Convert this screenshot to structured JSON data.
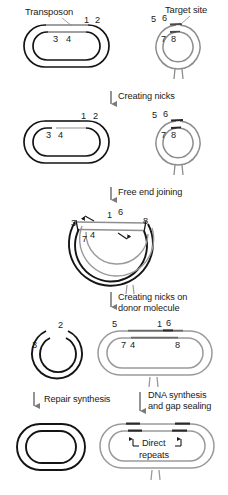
{
  "figure": {
    "width": 228,
    "height": 495,
    "background": "#ffffff",
    "colors": {
      "donor_dna": "#141414",
      "target_dna": "#8c8c8c",
      "text": "#1a1a1a",
      "arrow": "#6e6e6e"
    }
  },
  "headers": {
    "transposon": "Transposon",
    "target_site": "Target site"
  },
  "steps": {
    "creating_nicks": "Creating nicks",
    "free_end_joining": "Free end joining",
    "creating_nicks_donor_line1": "Creating nicks on",
    "creating_nicks_donor_line2": "donor molecule",
    "repair_synthesis": "Repair synthesis",
    "dna_synthesis_line1": "DNA synthesis",
    "dna_synthesis_line2": "and gap sealing"
  },
  "annotations": {
    "direct_line1": "Direct",
    "direct_line2": "repeats"
  },
  "stage1": {
    "name": "Intact donor and target molecules",
    "donor_numbers": [
      "1",
      "2",
      "3",
      "4"
    ],
    "target_numbers": [
      "5",
      "6",
      "7",
      "8"
    ]
  },
  "stage2": {
    "name": "Nicked donor and target molecules",
    "donor_numbers": [
      "1",
      "2",
      "3",
      "4"
    ],
    "target_numbers": [
      "5",
      "6",
      "7",
      "8"
    ]
  },
  "stage3": {
    "name": "Free end joining intermediate",
    "numbers": [
      "1",
      "6",
      "3",
      "8",
      "7",
      "4"
    ]
  },
  "stage4": {
    "name": "Nicked donor molecule and cointegrate",
    "donor_numbers": [
      "2",
      "3"
    ],
    "target_numbers": [
      "5",
      "1",
      "6",
      "7",
      "4",
      "8"
    ]
  },
  "stage5": {
    "name": "Repaired donor and sealed cointegrate",
    "donor_numbers": [],
    "target_numbers": []
  }
}
